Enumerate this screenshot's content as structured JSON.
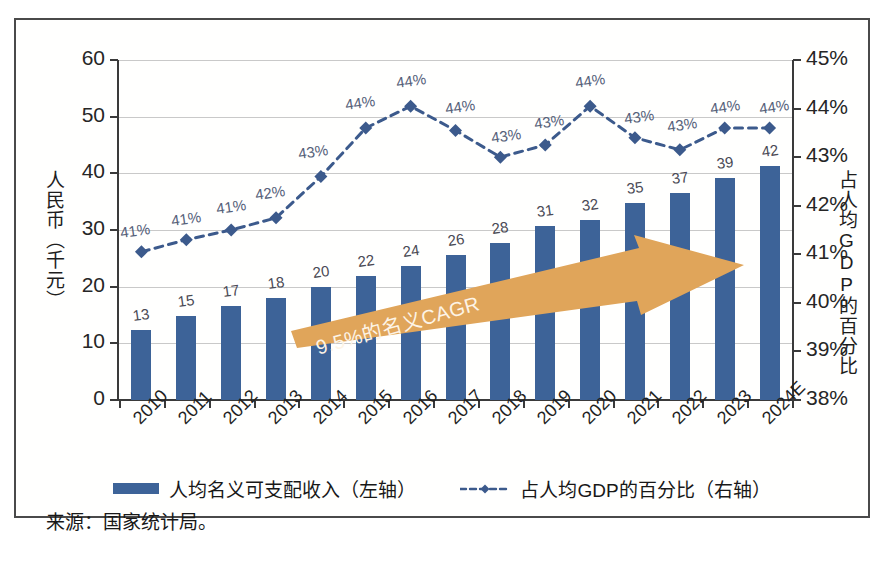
{
  "chart_data": {
    "type": "bar",
    "title": "",
    "subtitle": "",
    "xlabel": "",
    "ylabel": "人民币（千元）",
    "ylabel_right": "占人均GDP的百分比",
    "ylim": [
      0,
      60
    ],
    "ylim_right": [
      38,
      45
    ],
    "yticks": [
      "0",
      "10",
      "20",
      "30",
      "40",
      "50",
      "60"
    ],
    "yticks_right": [
      "38%",
      "39%",
      "40%",
      "41%",
      "42%",
      "43%",
      "44%",
      "45%"
    ],
    "grid": true,
    "legend_position": "bottom",
    "categories": [
      "2010",
      "2011",
      "2012",
      "2013",
      "2014",
      "2015",
      "2016",
      "2017",
      "2018",
      "2019",
      "2020",
      "2021",
      "2022",
      "2023",
      "2024E"
    ],
    "series": [
      {
        "name": "人均名义可支配收入（左轴）",
        "type": "bar",
        "axis": "left",
        "color": "#3d6398",
        "values": [
          12.3,
          14.8,
          16.6,
          18.0,
          20.0,
          21.8,
          23.6,
          25.6,
          27.7,
          30.7,
          31.8,
          34.8,
          36.5,
          39.2,
          41.3
        ],
        "labels": [
          "13",
          "15",
          "17",
          "18",
          "20",
          "22",
          "24",
          "26",
          "28",
          "31",
          "32",
          "35",
          "37",
          "39",
          "42"
        ]
      },
      {
        "name": "占人均GDP的百分比（右轴）",
        "type": "line",
        "axis": "right",
        "color": "#3c5a8c",
        "style": "dashed",
        "marker": "diamond",
        "values": [
          41.05,
          41.3,
          41.5,
          41.75,
          42.6,
          43.6,
          44.05,
          43.55,
          43.0,
          43.25,
          44.05,
          43.4,
          43.15,
          43.6,
          43.6
        ],
        "labels": [
          "41%",
          "41%",
          "41%",
          "42%",
          "43%",
          "44%",
          "44%",
          "44%",
          "43%",
          "43%",
          "44%",
          "43%",
          "43%",
          "44%",
          "44%"
        ]
      }
    ],
    "annotations": [
      {
        "name": "cagr-arrow",
        "text": "9.5%的名义CAGR",
        "color": "#e0a55a"
      }
    ],
    "source": "来源：国家统计局。"
  },
  "colors": {
    "bar": "#3d6398",
    "line": "#3c5a8c",
    "arrow": "#e0a55a",
    "arrow_text": "#fdf4e6",
    "grid": "#c9c9c9",
    "axis": "#3a3a3a",
    "frame": "#4a4a4a"
  }
}
